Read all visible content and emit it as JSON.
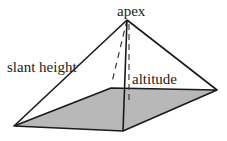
{
  "diagram": {
    "type": "square pyramid",
    "labels": {
      "apex": "apex",
      "slant_height": "slant height",
      "altitude": "altitude"
    },
    "colors": {
      "base_fill": "#b8b8b8",
      "stroke": "#1a1a1a"
    }
  }
}
